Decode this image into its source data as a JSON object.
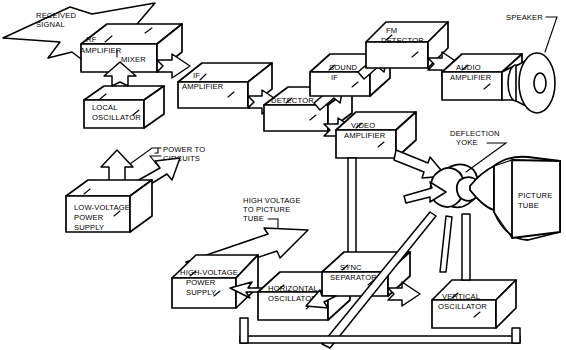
{
  "diagram": {
    "colors": {
      "background": "#ffffff",
      "line": "#000000",
      "fill": "#ffffff"
    },
    "blocks": [
      {
        "id": "rf-amplifier",
        "label_lines": [
          "RF",
          "AMPLIFIER"
        ]
      },
      {
        "id": "mixer",
        "label_lines": [
          "MIXER"
        ]
      },
      {
        "id": "local-oscillator",
        "label_lines": [
          "LOCAL",
          "OSCILLATOR"
        ]
      },
      {
        "id": "if-amplifier",
        "label_lines": [
          "IF",
          "AMPLIFIER"
        ]
      },
      {
        "id": "detector",
        "label_lines": [
          "DETECTOR"
        ]
      },
      {
        "id": "sound-if",
        "label_lines": [
          "SOUND",
          "IF"
        ]
      },
      {
        "id": "fm-detector",
        "label_lines": [
          "FM",
          "DETECTOR"
        ]
      },
      {
        "id": "audio-amplifier",
        "label_lines": [
          "AUDIO",
          "AMPLIFIER"
        ]
      },
      {
        "id": "video-amplifier",
        "label_lines": [
          "VIDEO",
          "AMPLIFIER"
        ]
      },
      {
        "id": "low-voltage-power-supply",
        "label_lines": [
          "LOW-VOLTAGE",
          "POWER",
          "SUPPLY"
        ]
      },
      {
        "id": "high-voltage-power-supply",
        "label_lines": [
          "HIGH-VOLTAGE",
          "POWER",
          "SUPPLY"
        ]
      },
      {
        "id": "horizontal-oscillator",
        "label_lines": [
          "HORIZONTAL",
          "OSCILLATOR"
        ]
      },
      {
        "id": "sync-separator",
        "label_lines": [
          "SYNC",
          "SEPARATOR"
        ]
      },
      {
        "id": "vertical-oscillator",
        "label_lines": [
          "VERTICAL",
          "OSCILLATOR"
        ]
      }
    ],
    "components": [
      {
        "id": "speaker",
        "label_lines": [
          "SPEAKER"
        ]
      },
      {
        "id": "picture-tube",
        "label_lines": [
          "PICTURE",
          "TUBE"
        ]
      },
      {
        "id": "deflection-yoke",
        "label_lines": [
          "DEFLECTION",
          "YOKE"
        ]
      }
    ],
    "annotations": [
      {
        "id": "received-signal",
        "label_lines": [
          "RECEIVED",
          "SIGNAL"
        ]
      },
      {
        "id": "power-to-circuits",
        "label_lines": [
          "POWER TO",
          "CIRCUITS"
        ]
      },
      {
        "id": "high-voltage-to-picture-tube",
        "label_lines": [
          "HIGH VOLTAGE",
          "TO PICTURE",
          "TUBE"
        ]
      }
    ],
    "labels": {
      "rf": "RF",
      "amplifier": "AMPLIFIER",
      "mixer": "MIXER",
      "local": "LOCAL",
      "oscillator": "OSCILLATOR",
      "if": "IF",
      "detector": "DETECTOR",
      "sound": "SOUND",
      "fm": "FM",
      "audio": "AUDIO",
      "video": "VIDEO",
      "speaker": "SPEAKER",
      "deflection": "DEFLECTION",
      "yoke": "YOKE",
      "picture": "PICTURE",
      "tube": "TUBE",
      "received": "RECEIVED",
      "signal": "SIGNAL",
      "power_to": "POWER TO",
      "circuits": "CIRCUITS",
      "low_voltage": "LOW-VOLTAGE",
      "power": "POWER",
      "supply": "SUPPLY",
      "high_voltage_hy": "HIGH-VOLTAGE",
      "high_voltage": "HIGH VOLTAGE",
      "to_picture": "TO PICTURE",
      "horizontal": "HORIZONTAL",
      "sync": "SYNC",
      "separator": "SEPARATOR",
      "vertical": "VERTICAL"
    }
  }
}
